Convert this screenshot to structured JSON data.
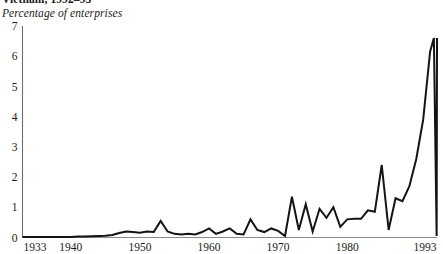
{
  "chart_data": {
    "type": "line",
    "title": "Vietnam, 1992–93",
    "subtitle": "Percentage of enterprises",
    "xlabel": "",
    "ylabel": "Percentage of enterprises",
    "xlim": [
      1933,
      1993
    ],
    "ylim": [
      0,
      7
    ],
    "grid": false,
    "legend": null,
    "yticks": [
      0,
      1,
      2,
      3,
      4,
      5,
      6,
      7
    ],
    "ytick_labels": [
      "0",
      "1",
      "2",
      "3",
      "4",
      "5",
      "6",
      "7"
    ],
    "xticks": [
      1933,
      1940,
      1950,
      1960,
      1970,
      1980,
      1993
    ],
    "xtick_labels": [
      "1933",
      "1940",
      "1950",
      "1960",
      "1970",
      "1980",
      "1993"
    ],
    "series": [
      {
        "name": "Percentage of enterprises",
        "color": "#141414",
        "x": [
          1933,
          1934,
          1935,
          1936,
          1937,
          1938,
          1939,
          1940,
          1941,
          1942,
          1943,
          1944,
          1945,
          1946,
          1947,
          1948,
          1949,
          1950,
          1951,
          1952,
          1953,
          1954,
          1955,
          1956,
          1957,
          1958,
          1959,
          1960,
          1961,
          1962,
          1963,
          1964,
          1965,
          1966,
          1967,
          1968,
          1969,
          1970,
          1971,
          1972,
          1973,
          1974,
          1975,
          1976,
          1977,
          1978,
          1979,
          1980,
          1981,
          1982,
          1983,
          1984,
          1985,
          1986,
          1987,
          1988,
          1989,
          1990,
          1991,
          1992,
          1993
        ],
        "y": [
          0.02,
          0.02,
          0.02,
          0.02,
          0.02,
          0.02,
          0.02,
          0.02,
          0.03,
          0.03,
          0.04,
          0.05,
          0.06,
          0.08,
          0.15,
          0.2,
          0.18,
          0.16,
          0.2,
          0.18,
          0.55,
          0.2,
          0.12,
          0.1,
          0.12,
          0.1,
          0.18,
          0.3,
          0.12,
          0.2,
          0.3,
          0.12,
          0.1,
          0.6,
          0.25,
          0.18,
          0.3,
          0.22,
          0.05,
          1.35,
          0.25,
          1.1,
          0.2,
          0.95,
          0.65,
          1.0,
          0.35,
          0.6,
          0.62,
          0.62,
          0.9,
          0.85,
          2.4,
          0.25,
          1.3,
          1.2,
          1.7,
          2.6,
          3.9,
          6.15,
          6.6
        ],
        "x_extra": [
          1992.55,
          1992.95
        ],
        "y_extra": [
          6.6,
          0.05
        ]
      }
    ],
    "annotations": []
  }
}
